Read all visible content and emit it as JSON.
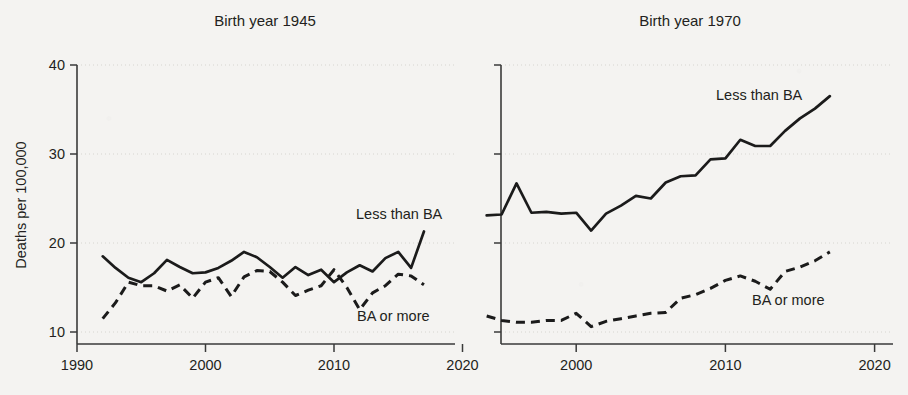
{
  "figure": {
    "background_color": "#f4f3f1",
    "ink_color": "#1b1b1b",
    "grid_color": "#cfcdc9"
  },
  "axis": {
    "ylabel": "Deaths per 100,000",
    "ytick_labels": [
      "40",
      "30",
      "20",
      "10"
    ],
    "ytick_values": [
      40,
      30,
      20,
      10
    ],
    "xtick_labels_left": [
      "1990",
      "2000",
      "2010",
      "2020"
    ],
    "xtick_labels_right": [
      "2000",
      "2010",
      "2020"
    ],
    "xlim": [
      1990,
      2020
    ],
    "ylim": [
      10,
      40
    ]
  },
  "panels": [
    {
      "id": "left",
      "title": "Birth year 1945",
      "label_less": "Less than BA",
      "label_ba": "BA or more"
    },
    {
      "id": "right",
      "title": "Birth year 1970",
      "label_less": "Less than BA",
      "label_ba": "BA or more"
    }
  ],
  "chart_data": [
    {
      "type": "line",
      "title": "Birth year 1945",
      "xlabel": "",
      "ylabel": "Deaths per 100,000",
      "xlim": [
        1990,
        2020
      ],
      "ylim": [
        10,
        40
      ],
      "grid": true,
      "legend": "inline-annotation",
      "yticks": [
        10,
        20,
        30,
        40
      ],
      "xticks": [
        1990,
        2000,
        2010,
        2020
      ],
      "series": [
        {
          "name": "Less than BA",
          "style": "solid",
          "x": [
            1992,
            1993,
            1994,
            1995,
            1996,
            1997,
            1998,
            1999,
            2000,
            2001,
            2002,
            2003,
            2004,
            2005,
            2006,
            2007,
            2008,
            2009,
            2010,
            2011,
            2012,
            2013,
            2014,
            2015,
            2016,
            2017
          ],
          "values": [
            18.5,
            17.2,
            16.1,
            15.6,
            16.6,
            18.1,
            17.3,
            16.6,
            16.7,
            17.2,
            18.0,
            19.0,
            18.4,
            17.3,
            16.1,
            17.3,
            16.4,
            17.0,
            15.6,
            16.7,
            17.5,
            16.8,
            18.3,
            19.0,
            17.2,
            21.3
          ]
        },
        {
          "name": "BA or more",
          "style": "dashed",
          "x": [
            1992,
            1993,
            1994,
            1995,
            1996,
            1997,
            1998,
            1999,
            2000,
            2001,
            2002,
            2003,
            2004,
            2005,
            2006,
            2007,
            2008,
            2009,
            2010,
            2011,
            2012,
            2013,
            2014,
            2015,
            2016,
            2017
          ],
          "values": [
            11.5,
            13.3,
            15.6,
            15.2,
            15.2,
            14.6,
            15.3,
            13.8,
            15.6,
            16.1,
            14.0,
            16.2,
            16.9,
            16.8,
            15.6,
            14.1,
            14.7,
            15.2,
            17.0,
            15.0,
            12.5,
            14.4,
            15.2,
            16.5,
            16.3,
            15.3
          ]
        }
      ]
    },
    {
      "type": "line",
      "title": "Birth year 1970",
      "xlabel": "",
      "ylabel": "Deaths per 100,000",
      "xlim": [
        1990,
        2020
      ],
      "ylim": [
        10,
        40
      ],
      "grid": true,
      "legend": "inline-annotation",
      "yticks": [
        10,
        20,
        30,
        40
      ],
      "xticks": [
        2000,
        2010,
        2020
      ],
      "series": [
        {
          "name": "Less than BA",
          "style": "solid",
          "x": [
            1994,
            1995,
            1996,
            1997,
            1998,
            1999,
            2000,
            2001,
            2002,
            2003,
            2004,
            2005,
            2006,
            2007,
            2008,
            2009,
            2010,
            2011,
            2012,
            2013,
            2014,
            2015,
            2016,
            2017
          ],
          "values": [
            23.1,
            23.2,
            26.7,
            23.4,
            23.5,
            23.3,
            23.4,
            21.4,
            23.3,
            24.2,
            25.3,
            25.0,
            26.8,
            27.5,
            27.6,
            29.4,
            29.5,
            31.6,
            30.9,
            30.9,
            32.6,
            34.0,
            35.1,
            36.5
          ]
        },
        {
          "name": "BA or more",
          "style": "dashed",
          "x": [
            1994,
            1995,
            1996,
            1997,
            1998,
            1999,
            2000,
            2001,
            2002,
            2003,
            2004,
            2005,
            2006,
            2007,
            2008,
            2009,
            2010,
            2011,
            2012,
            2013,
            2014,
            2015,
            2016,
            2017
          ],
          "values": [
            11.8,
            11.3,
            11.1,
            11.1,
            11.3,
            11.3,
            12.1,
            10.6,
            11.2,
            11.5,
            11.8,
            12.1,
            12.2,
            13.8,
            14.2,
            14.9,
            15.8,
            16.3,
            15.7,
            14.8,
            16.8,
            17.3,
            18.0,
            19.0
          ]
        }
      ]
    }
  ]
}
